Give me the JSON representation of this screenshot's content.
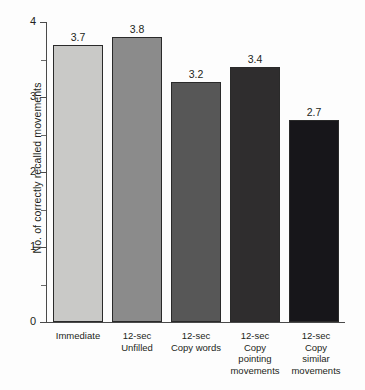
{
  "chart_data": {
    "type": "bar",
    "title": "",
    "xlabel": "",
    "ylabel": "No. of correctly recalled movements",
    "ylim": [
      0,
      4
    ],
    "grid": false,
    "legend": false,
    "y_ticks": [
      "0",
      "1",
      "2",
      "3",
      "4"
    ],
    "y_minor_ticks": [
      0.5,
      1.5,
      2.5,
      3.5
    ],
    "categories": [
      "Immediate",
      "12-sec\nUnfilled",
      "12-sec\nCopy words",
      "12-sec\nCopy\npointing\nmovements",
      "12-sec\nCopy\nsimilar\nmovements"
    ],
    "values": [
      3.7,
      3.8,
      3.2,
      3.4,
      2.7
    ],
    "value_labels": [
      "3.7",
      "3.8",
      "3.2",
      "3.4",
      "2.7"
    ],
    "bar_colors": [
      "#c9c9c7",
      "#8b8b8b",
      "#575757",
      "#2f2d2e",
      "#17161a"
    ],
    "bar_border_color": "#2a2a2a",
    "axis_color": "#4a4a4a",
    "text_color": "#231f20",
    "background": "#fdfdfd"
  }
}
